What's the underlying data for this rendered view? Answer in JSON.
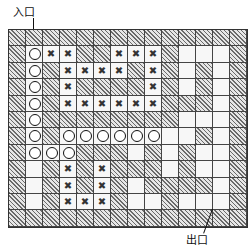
{
  "labels": {
    "entry": "入口",
    "exit": "出口"
  },
  "legend": {
    "W": "wall (hatched)",
    "O": "path taken (circle)",
    "X": "dead-end / backtracked (cross)",
    "_": "open cell"
  },
  "maze": {
    "rows": 12,
    "cols": 14,
    "grid": [
      "WWWWWWWWWWWWWW",
      "WOXXWWXXXW___W",
      "WOWXXXXWXW_W_W",
      "WOWXWWWWXW_W_W",
      "WOWXXXXXXWWW_W",
      "WOWWWWWWWW___W",
      "WOWOOOOOO__W_W",
      "WOOOWWW_W_W__W",
      "W_WXWXWWW_W__W",
      "W_WXWXW_WWWW_W",
      "W_WXXXW__W___W",
      "WWWWWWWWWWWWWW"
    ]
  }
}
